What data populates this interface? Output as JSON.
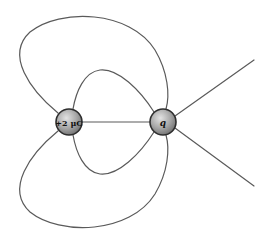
{
  "diagram": {
    "colors": {
      "background": "#ffffff",
      "field_line": "#5a5a5a",
      "charge_fill_light": "#d8d8d8",
      "charge_fill_dark": "#7a7a7a",
      "charge_outline": "#2e2e2e"
    },
    "charges": [
      {
        "id": "left",
        "label": "+2 μC",
        "cx": 69,
        "cy": 122,
        "r": 13
      },
      {
        "id": "right",
        "label": "q",
        "cx": 163,
        "cy": 122,
        "r": 13
      }
    ],
    "field_lines": [
      {
        "name": "outer-top-loop",
        "d": "M 58 113 C 30 90, 5 55, 30 32 C 60 8, 130 10, 155 50 C 168 72, 170 95, 166 109"
      },
      {
        "name": "inner-top-loop",
        "d": "M 73 109 C 76 92, 84 72, 100 70 C 118 68, 140 90, 154 112"
      },
      {
        "name": "center-line",
        "d": "M 82 122 L 150 122"
      },
      {
        "name": "inner-bottom-loop",
        "d": "M 73 135 C 76 152, 84 172, 100 174 C 118 176, 140 154, 154 132"
      },
      {
        "name": "outer-bottom-loop",
        "d": "M 58 131 C 30 154, 5 189, 30 212 C 60 236, 130 234, 155 194 C 168 172, 170 149, 166 135"
      },
      {
        "name": "right-upper-line",
        "d": "M 175 116 L 254 60"
      },
      {
        "name": "right-lower-line",
        "d": "M 175 128 L 254 186"
      }
    ]
  }
}
